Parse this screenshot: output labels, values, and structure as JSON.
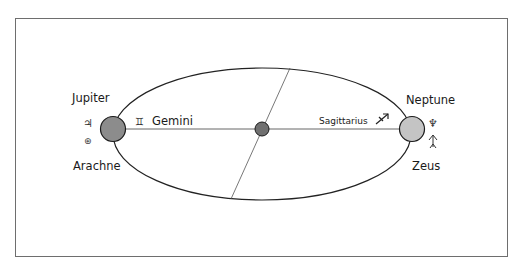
{
  "diagram": {
    "type": "orbit-diagram",
    "colors": {
      "frame": "#6e6e6e",
      "ellipse": "#222222",
      "axis_line": "#555555",
      "left_body_fill": "#8c8c8c",
      "right_body_fill": "#c4c4c4",
      "center_body_fill": "#707070",
      "body_stroke": "#1a1a1a"
    },
    "left_body": {
      "top_label": "Jupiter",
      "bottom_label": "Arachne",
      "symbol_top": "♃",
      "symbol_bottom": "⊛",
      "top_symbol_name": "jupiter-symbol",
      "bottom_symbol_name": "arachne-symbol"
    },
    "right_body": {
      "top_label": "Neptune",
      "bottom_label": "Zeus",
      "symbol_top": "♆",
      "symbol_bottom": "⯫",
      "top_symbol_name": "neptune-symbol",
      "bottom_symbol_name": "zeus-symbol"
    },
    "axis_labels": {
      "left": {
        "symbol": "♊",
        "text": "Gemini"
      },
      "right": {
        "text": "Sagittarius",
        "symbol": "♐"
      }
    }
  }
}
